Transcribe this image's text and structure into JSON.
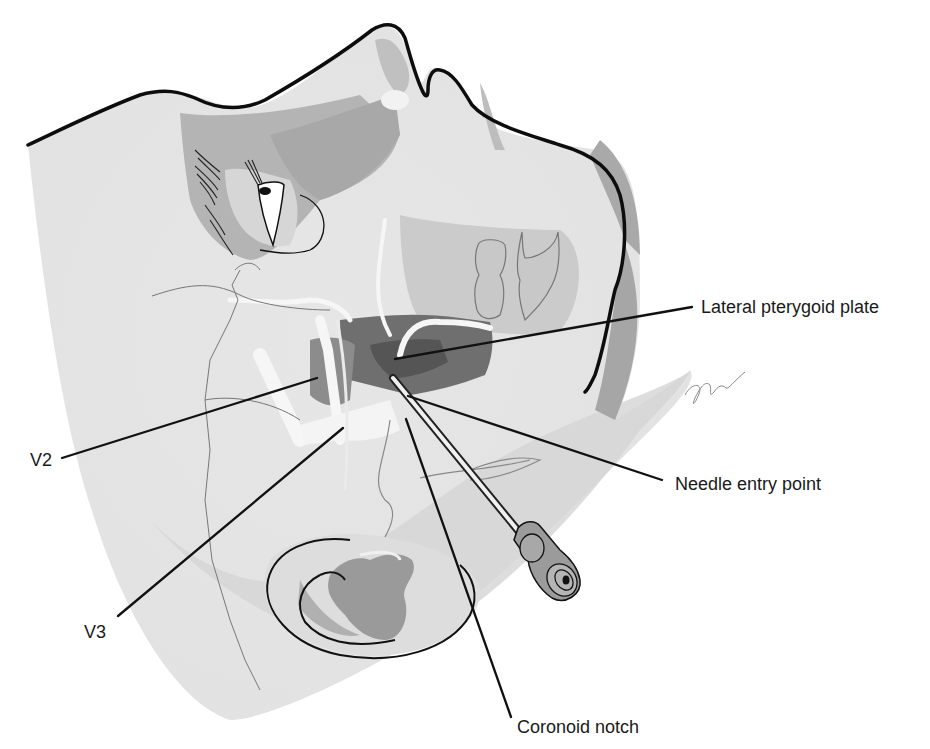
{
  "figure": {
    "labels": {
      "lateral_pterygoid_plate": "Lateral pterygoid plate",
      "needle_entry_point": "Needle entry point",
      "coronoid_notch": "Coronoid notch",
      "v2": "V2",
      "v3": "V3"
    },
    "signature": "J.Bloch",
    "colors": {
      "background": "#ffffff",
      "skin_light": "#e9e9e9",
      "skin_mid": "#cfcfcf",
      "shade_dark": "#8f8f8f",
      "shade_darker": "#6b6b6b",
      "outline": "#111111",
      "nerve": "#f6f6f6"
    }
  }
}
